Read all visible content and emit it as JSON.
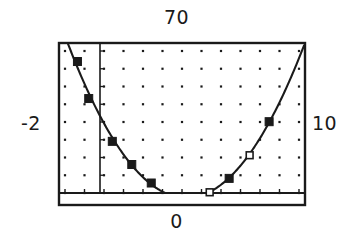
{
  "chart_data": {
    "type": "line",
    "title": "",
    "subtitle": "",
    "xlabel": "",
    "ylabel": "",
    "xlim": [
      -2,
      10
    ],
    "ylim": [
      0,
      70
    ],
    "grid": true,
    "grid_style": "dots",
    "legend": "none",
    "axis_labels": {
      "top": "70",
      "bottom": "0",
      "left": "-2",
      "right": "10"
    },
    "series": [
      {
        "name": "parabola",
        "marker": "square",
        "x": [
          -1.1,
          -0.55,
          0.6,
          1.55,
          2.5,
          3.45,
          4.35,
          5.35,
          6.3,
          7.3,
          8.25
        ],
        "y": [
          62.0,
          46.0,
          27.5,
          17.5,
          9.5,
          5.0,
          3.5,
          5.5,
          11.5,
          21.5,
          36.0
        ],
        "marker_fill": [
          "filled",
          "filled",
          "filled",
          "filled",
          "filled",
          "open",
          "filled",
          "open",
          "filled",
          "open",
          "filled"
        ]
      }
    ],
    "curve": {
      "description": "smooth upward-opening parabola through the plotted points",
      "vertex_x": 4.2,
      "vertex_y": 3.2
    }
  },
  "plot": {
    "frame_color": "#1a1a1a",
    "curve_color": "#1a1a1a",
    "grid_dot_color": "#1a1a1a",
    "background": "#ffffff"
  }
}
